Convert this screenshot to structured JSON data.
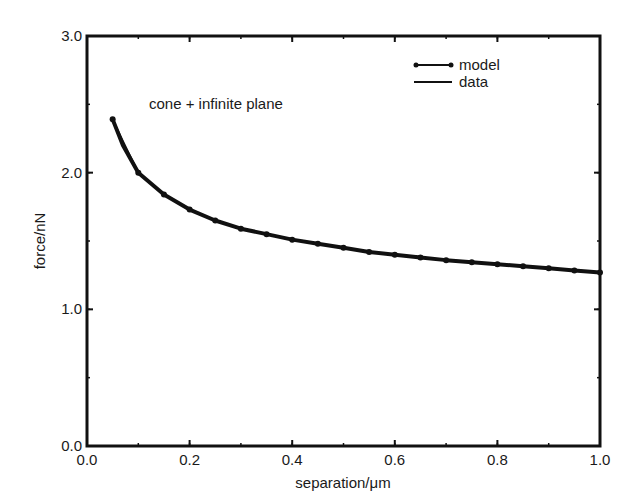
{
  "chart_data": {
    "type": "line",
    "title": "",
    "annotation": "cone + infinite plane",
    "xlabel": "separation/μm",
    "ylabel": "force/nN",
    "xlim": [
      0.0,
      1.0
    ],
    "ylim": [
      0.0,
      3.0
    ],
    "x_ticks": [
      "0.0",
      "0.2",
      "0.4",
      "0.6",
      "0.8",
      "1.0"
    ],
    "y_ticks": [
      "0.0",
      "1.0",
      "2.0",
      "3.0"
    ],
    "x_minor_step": 0.1,
    "y_minor_step": 0.5,
    "grid": false,
    "legend_position": "upper right",
    "legend": [
      {
        "name": "model",
        "style": "line-with-circle-markers"
      },
      {
        "name": "data",
        "style": "line"
      }
    ],
    "series": [
      {
        "name": "model",
        "x": [
          0.05,
          0.1,
          0.15,
          0.2,
          0.25,
          0.3,
          0.35,
          0.4,
          0.45,
          0.5,
          0.55,
          0.6,
          0.65,
          0.7,
          0.75,
          0.8,
          0.85,
          0.9,
          0.95,
          1.0
        ],
        "values": [
          2.39,
          2.0,
          1.84,
          1.73,
          1.65,
          1.59,
          1.55,
          1.51,
          1.48,
          1.45,
          1.42,
          1.4,
          1.38,
          1.36,
          1.345,
          1.33,
          1.315,
          1.3,
          1.285,
          1.27
        ]
      },
      {
        "name": "data",
        "x": [
          0.05,
          0.07,
          0.1,
          0.15,
          0.2,
          0.25,
          0.3,
          0.35,
          0.4,
          0.45,
          0.5,
          0.55,
          0.6,
          0.65,
          0.7,
          0.75,
          0.8,
          0.85,
          0.9,
          0.95,
          1.0
        ],
        "values": [
          2.39,
          2.2,
          2.0,
          1.84,
          1.73,
          1.65,
          1.59,
          1.55,
          1.51,
          1.48,
          1.45,
          1.42,
          1.4,
          1.38,
          1.36,
          1.345,
          1.33,
          1.315,
          1.3,
          1.285,
          1.27
        ]
      }
    ]
  }
}
